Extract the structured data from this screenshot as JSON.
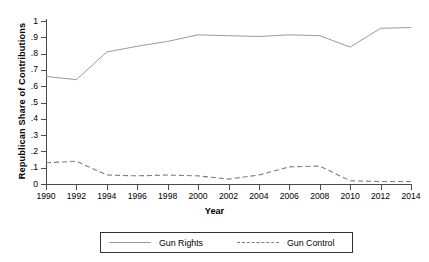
{
  "chart_data": {
    "type": "line",
    "title": "",
    "xlabel": "Year",
    "ylabel": "Republican Share of Contributions",
    "x": [
      1990,
      1992,
      1994,
      1996,
      1998,
      2000,
      2002,
      2004,
      2006,
      2008,
      2010,
      2012,
      2014
    ],
    "xlim": [
      1990,
      2014
    ],
    "ylim": [
      0,
      1
    ],
    "xticks": [
      "1990",
      "1992",
      "1994",
      "1996",
      "1998",
      "2000",
      "2002",
      "2004",
      "2006",
      "2008",
      "2010",
      "2012",
      "2014"
    ],
    "yticks": [
      "0",
      ".1",
      ".2",
      ".3",
      ".4",
      ".5",
      ".6",
      ".7",
      ".8",
      ".9",
      "1"
    ],
    "ytick_values": [
      0,
      0.1,
      0.2,
      0.3,
      0.4,
      0.5,
      0.6,
      0.7,
      0.8,
      0.9,
      1
    ],
    "grid": false,
    "legend_position": "below-center",
    "series": [
      {
        "name": "Gun Rights",
        "style": "solid",
        "color": "#9a9a9a",
        "values": [
          0.66,
          0.64,
          0.81,
          0.845,
          0.875,
          0.915,
          0.91,
          0.905,
          0.915,
          0.91,
          0.84,
          0.955,
          0.96
        ]
      },
      {
        "name": "Gun Control",
        "style": "dashed",
        "color": "#7d7d7d",
        "values": [
          0.13,
          0.14,
          0.055,
          0.05,
          0.055,
          0.05,
          0.03,
          0.055,
          0.105,
          0.11,
          0.02,
          0.015,
          0.015
        ]
      }
    ]
  },
  "legend": {
    "entries": [
      {
        "label": "Gun Rights"
      },
      {
        "label": "Gun Control"
      }
    ]
  },
  "axes": {
    "y_title": "Republican Share of Contributions",
    "x_title": "Year"
  }
}
